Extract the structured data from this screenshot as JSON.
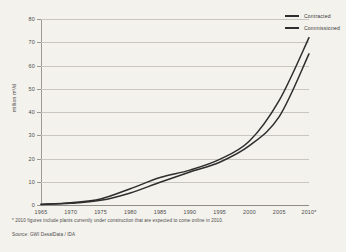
{
  "chart_data": {
    "type": "line",
    "title": "",
    "xlabel": "",
    "ylabel": "million m³/d",
    "xlim": [
      1965,
      2010
    ],
    "ylim": [
      0,
      80
    ],
    "grid": true,
    "legend_position": "top-right",
    "xticks": [
      "1965",
      "1970",
      "1975",
      "1980",
      "1985",
      "1990",
      "1995",
      "2000",
      "2005",
      "2010*"
    ],
    "yticks": [
      "0",
      "10",
      "20",
      "30",
      "40",
      "50",
      "60",
      "70",
      "80"
    ],
    "x": [
      1965,
      1970,
      1975,
      1980,
      1985,
      1990,
      1995,
      2000,
      2005,
      2010
    ],
    "series": [
      {
        "name": "Contracted",
        "color": "#2e2e2e",
        "values": [
          0.3,
          1.0,
          2.6,
          7.0,
          11.8,
          15.0,
          19.6,
          27.5,
          45.0,
          72.0
        ]
      },
      {
        "name": "Commissioned",
        "color": "#2e2e2e",
        "values": [
          0.2,
          0.7,
          2.0,
          5.2,
          9.8,
          14.2,
          18.4,
          25.5,
          38.0,
          65.0
        ]
      }
    ],
    "annotations": [
      "* 2010 figures include plants currently under construction that are expected to come online in 2010.",
      "Source: GWI DesalData / IDA"
    ]
  },
  "legend": {
    "items": [
      {
        "label": "Contracted"
      },
      {
        "label": "Commissioned"
      }
    ]
  },
  "notes": {
    "footnote": "* 2010 figures include plants currently under construction that are expected to come online in 2010.",
    "source": "Source: GWI DesalData / IDA"
  },
  "axes": {
    "y_title": "million m³/d"
  }
}
